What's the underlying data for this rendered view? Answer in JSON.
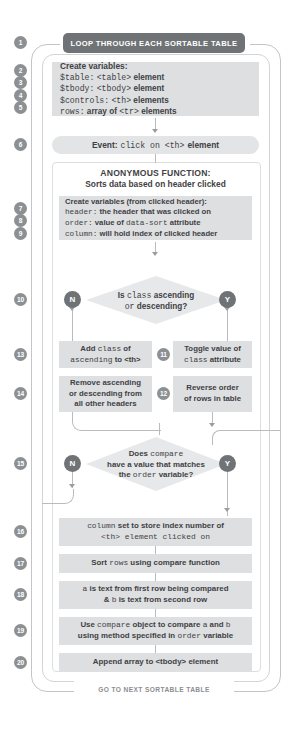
{
  "header": {
    "banner": "LOOP THROUGH EACH SORTABLE TABLE"
  },
  "footer": {
    "label": "GO TO NEXT SORTABLE TABLE"
  },
  "function_panel": {
    "title": "ANONYMOUS FUNCTION:",
    "subtitle": "Sorts data based on header clicked"
  },
  "steps": {
    "s1": "1",
    "s2": "2",
    "s3": "3",
    "s4": "4",
    "s5": "5",
    "s6": "6",
    "s7": "7",
    "s8": "8",
    "s9": "9",
    "s10": "10",
    "s11": "11",
    "s12": "12",
    "s13": "13",
    "s14": "14",
    "s15": "15",
    "s16": "16",
    "s17": "17",
    "s18": "18",
    "s19": "19",
    "s20": "20"
  },
  "vars_block_1": {
    "title": "Create variables:",
    "line1_a": "$table:",
    "line1_b": "<table>",
    "line1_c": "element",
    "line2_a": "$tbody:",
    "line2_b": "<tbody>",
    "line2_c": "element",
    "line3_a": "$controls:",
    "line3_b": "<th>",
    "line3_c": "elements",
    "line4_a": "rows:",
    "line4_b": "array of",
    "line4_c": "<tr>",
    "line4_d": "elements"
  },
  "event_pill": {
    "label": "Event:",
    "code": "click on <th>",
    "tail": "element"
  },
  "vars_block_2": {
    "title": "Create variables (from clicked header):",
    "line1_a": "header:",
    "line1_b": "the header that was clicked on",
    "line2_a": "order:",
    "line2_b": "value of",
    "line2_c": "data-sort",
    "line2_d": "attribute",
    "line3_a": "column:",
    "line3_b": "will hold index of clicked header"
  },
  "decision_1": {
    "line1_a": "Is",
    "line1_b": "class",
    "line1_c": "ascending",
    "line2_a": "or",
    "line2_b": "descending?",
    "no": "N",
    "yes": "Y"
  },
  "box_13": {
    "line1_a": "Add",
    "line1_b": "class",
    "line1_c": "of",
    "line2_a": "ascending",
    "line2_b": "to <th>"
  },
  "box_14": {
    "line1": "Remove ascending",
    "line2": "or descending from",
    "line3": "all other headers"
  },
  "box_11": {
    "line1": "Toggle value of",
    "line2_a": "class",
    "line2_b": "attribute"
  },
  "box_12": {
    "line1": "Reverse order",
    "line2": "of rows in table"
  },
  "decision_2": {
    "line1_a": "Does",
    "line1_b": "compare",
    "line2": "have a value that matches",
    "line3_a": "the",
    "line3_b": "order",
    "line3_c": "variable?",
    "no": "N",
    "yes": "Y"
  },
  "box_16": {
    "line1_a": "column",
    "line1_b": "set to store index number of",
    "line2": "<th> element clicked on"
  },
  "box_17": {
    "a": "Sort",
    "b": "rows",
    "c": "using compare function"
  },
  "box_18": {
    "line1_a": "a",
    "line1_b": "is text from first row being compared",
    "line2_a": "&",
    "line2_b": "b",
    "line2_c": "is text from second row"
  },
  "box_19": {
    "line1_a": "Use",
    "line1_b": "compare",
    "line1_c": "object to compare",
    "line1_d": "a",
    "line1_e": "and",
    "line1_f": "b",
    "line2_a": "using method specified in",
    "line2_b": "order",
    "line2_c": "variable"
  },
  "box_20": {
    "text": "Append array to <tbody> element"
  }
}
